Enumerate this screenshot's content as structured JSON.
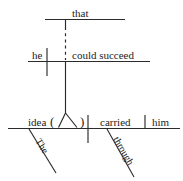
{
  "diagram": {
    "type": "reed-kellogg-sentence-diagram",
    "sentence": "The idea that he could succeed carried him through.",
    "ink_color": "#2b2b2b",
    "text_color": "#1d1d1d",
    "background_color": "#ffffff",
    "levels": {
      "relative_top": {
        "name": "subordinating-conjunction-level",
        "words": [
          {
            "id": "that",
            "text": "that",
            "role": "subordinating-conjunction"
          }
        ]
      },
      "subordinate_clause": {
        "name": "noun-clause-level",
        "words": [
          {
            "id": "he",
            "text": "he",
            "role": "clause-subject"
          },
          {
            "id": "could-succeed",
            "text": "could succeed",
            "role": "clause-predicate"
          }
        ]
      },
      "main_clause": {
        "name": "main-clause-level",
        "words": [
          {
            "id": "idea",
            "text": "idea",
            "role": "subject"
          },
          {
            "id": "carried",
            "text": "carried",
            "role": "verb"
          },
          {
            "id": "him",
            "text": "him",
            "role": "direct-object"
          }
        ],
        "modifiers": [
          {
            "id": "the",
            "text": "The",
            "role": "article-modifier",
            "attaches_to": "idea"
          },
          {
            "id": "through",
            "text": "through",
            "role": "adverb-modifier",
            "attaches_to": "carried"
          }
        ],
        "placeholder": {
          "id": "appositive-slot",
          "open_paren": "(",
          "close_paren": ")",
          "role": "appositive-noun-clause-stand"
        }
      }
    }
  }
}
